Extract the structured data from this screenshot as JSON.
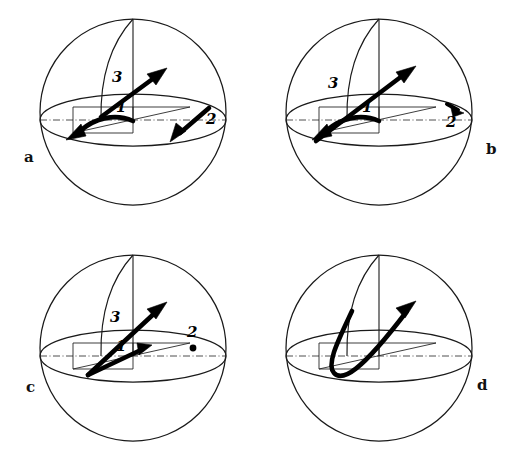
{
  "figure": {
    "domain": "Diagram",
    "background_color": "#ffffff",
    "ink_color": "#000000",
    "panel_count": 4,
    "grid": "2 rows x 2 columns"
  },
  "panels": [
    {
      "id": "a",
      "label": "a",
      "label_position": "left-of-sphere",
      "vector_labels": [
        "1",
        "2",
        "3"
      ],
      "markers": [],
      "items": [
        {
          "name": "1",
          "kind": "curved-arrow",
          "direction": "equatorial, from centre toward lower-left",
          "head": "single"
        },
        {
          "name": "2",
          "kind": "straight-arrow",
          "direction": "down-left, at right side of equator",
          "head": "single"
        },
        {
          "name": "3",
          "kind": "straight-arrow",
          "direction": "up-right, rising out of equatorial plane",
          "head": "single"
        }
      ]
    },
    {
      "id": "b",
      "label": "b",
      "label_position": "right-of-sphere",
      "vector_labels": [
        "1",
        "2",
        "3"
      ],
      "markers": [],
      "items": [
        {
          "name": "1",
          "kind": "curved-arrow",
          "direction": "equatorial, from centre toward lower-left",
          "head": "single"
        },
        {
          "name": "2",
          "kind": "short-arrowhead",
          "direction": "small arrowhead at right rim of equator",
          "head": "single"
        },
        {
          "name": "3",
          "kind": "straight-arrow",
          "direction": "long shaft up-right, crossing below the equator",
          "head": "single"
        }
      ]
    },
    {
      "id": "c",
      "label": "c",
      "label_position": "left-of-sphere",
      "vector_labels": [
        "1",
        "2",
        "3"
      ],
      "markers": [
        {
          "name": "2",
          "kind": "dot",
          "meaning": "point marker on the equator, no arrow"
        }
      ],
      "items": [
        {
          "name": "1",
          "kind": "straight-arrow",
          "direction": "up-right along equatorial plane from lower-left origin",
          "head": "single"
        },
        {
          "name": "3",
          "kind": "straight-arrow",
          "direction": "up-right out of plane from same lower-left origin",
          "head": "single"
        }
      ]
    },
    {
      "id": "d",
      "label": "d",
      "label_position": "right-of-sphere",
      "vector_labels": [],
      "markers": [],
      "items": [
        {
          "name": "hook",
          "kind": "hooked-curved-arrow",
          "direction": "J-shaped: descends left, loops at bottom, sweeps up-right",
          "head": "single"
        }
      ]
    }
  ],
  "sphere_geometry": {
    "outline": "circle",
    "equator": "ellipse seen obliquely from slightly above",
    "meridian": "single arc from north pole curving to the left limb",
    "polar_axis": "vertical segment from north pole down to sphere centre",
    "reference_axis": "horizontal dash-dot line across the equator",
    "construction_lines": "thin straight chords in the equatorial plane"
  }
}
